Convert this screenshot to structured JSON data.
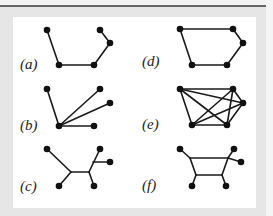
{
  "figure": {
    "panels": [
      {
        "id": "a",
        "label": "(a)",
        "label_pos": [
          20,
          57
        ],
        "nodes": [
          [
            47,
            30
          ],
          [
            59,
            65
          ],
          [
            94,
            65
          ],
          [
            110,
            43
          ],
          [
            100,
            30
          ]
        ],
        "edges": [
          [
            0,
            1
          ],
          [
            1,
            2
          ],
          [
            2,
            3
          ],
          [
            3,
            4
          ]
        ],
        "junctions": []
      },
      {
        "id": "b",
        "label": "(b)",
        "label_pos": [
          20,
          118
        ],
        "nodes": [
          [
            59,
            126
          ],
          [
            47,
            89
          ],
          [
            100,
            89
          ],
          [
            110,
            103
          ],
          [
            94,
            126
          ]
        ],
        "edges": [
          [
            0,
            1
          ],
          [
            0,
            2
          ],
          [
            0,
            3
          ],
          [
            0,
            4
          ]
        ],
        "junctions": []
      },
      {
        "id": "c",
        "label": "(c)",
        "label_pos": [
          20,
          179
        ],
        "nodes": [
          [
            47,
            149
          ],
          [
            100,
            149
          ],
          [
            110,
            162
          ],
          [
            59,
            186
          ],
          [
            94,
            186
          ]
        ],
        "junctions": [
          [
            71,
            172
          ],
          [
            89,
            172
          ],
          [
            93,
            162
          ]
        ],
        "edges_raw": [
          [
            [
              47,
              149
            ],
            [
              71,
              172
            ]
          ],
          [
            [
              71,
              172
            ],
            [
              59,
              186
            ]
          ],
          [
            [
              71,
              172
            ],
            [
              89,
              172
            ]
          ],
          [
            [
              89,
              172
            ],
            [
              94,
              186
            ]
          ],
          [
            [
              89,
              172
            ],
            [
              100,
              149
            ]
          ],
          [
            [
              93,
              162
            ],
            [
              110,
              162
            ]
          ]
        ]
      },
      {
        "id": "d",
        "label": "(d)",
        "label_pos": [
          142,
          54
        ],
        "nodes": [
          [
            180,
            29
          ],
          [
            233,
            29
          ],
          [
            243,
            43
          ],
          [
            227,
            65
          ],
          [
            192,
            65
          ]
        ],
        "edges": [
          [
            0,
            1
          ],
          [
            1,
            2
          ],
          [
            2,
            3
          ],
          [
            3,
            4
          ],
          [
            4,
            0
          ]
        ],
        "junctions": []
      },
      {
        "id": "e",
        "label": "(e)",
        "label_pos": [
          142,
          117
        ],
        "nodes": [
          [
            180,
            89
          ],
          [
            233,
            89
          ],
          [
            243,
            103
          ],
          [
            227,
            125
          ],
          [
            192,
            125
          ]
        ],
        "edges": [
          [
            0,
            1
          ],
          [
            0,
            2
          ],
          [
            0,
            3
          ],
          [
            0,
            4
          ],
          [
            1,
            2
          ],
          [
            1,
            3
          ],
          [
            1,
            4
          ],
          [
            2,
            3
          ],
          [
            2,
            4
          ],
          [
            3,
            4
          ]
        ],
        "junctions": []
      },
      {
        "id": "f",
        "label": "(f)",
        "label_pos": [
          142,
          178
        ],
        "nodes": [
          [
            180,
            149
          ],
          [
            234,
            149
          ],
          [
            241,
            162
          ],
          [
            192,
            186
          ],
          [
            226,
            186
          ]
        ],
        "junctions": [
          [
            190,
            158
          ],
          [
            228,
            158
          ],
          [
            196,
            175
          ],
          [
            222,
            175
          ]
        ],
        "edges_raw": [
          [
            [
              180,
              149
            ],
            [
              190,
              158
            ]
          ],
          [
            [
              190,
              158
            ],
            [
              228,
              158
            ]
          ],
          [
            [
              190,
              158
            ],
            [
              196,
              175
            ]
          ],
          [
            [
              196,
              175
            ],
            [
              222,
              175
            ]
          ],
          [
            [
              196,
              175
            ],
            [
              192,
              186
            ]
          ],
          [
            [
              222,
              175
            ],
            [
              226,
              186
            ]
          ],
          [
            [
              222,
              175
            ],
            [
              228,
              158
            ]
          ],
          [
            [
              228,
              158
            ],
            [
              234,
              149
            ]
          ],
          [
            [
              228,
              158
            ],
            [
              241,
              162
            ]
          ]
        ]
      }
    ],
    "colors": {
      "edge": "#1a1a1a",
      "node": "#111111",
      "panel_bg": "#ffffff",
      "frame_bg": "#e6e6e6",
      "top_rule": "#666666"
    }
  }
}
